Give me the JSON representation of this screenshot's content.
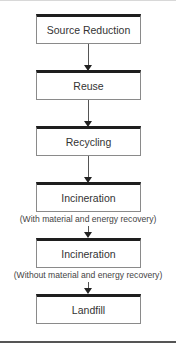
{
  "diagram": {
    "type": "flowchart",
    "direction": "top-to-bottom",
    "boxes": [
      {
        "label": "Source Reduction"
      },
      {
        "label": "Reuse"
      },
      {
        "label": "Recycling"
      },
      {
        "label": "Incineration",
        "caption": "(With material and energy recovery)"
      },
      {
        "label": "Incineration",
        "caption": "(Without material and energy recovery)"
      },
      {
        "label": "Landfill"
      }
    ],
    "colors": {
      "box_top_border": "#1e1e1e",
      "box_border": "#8a8a8a",
      "arrow": "#222222",
      "text": "#333333"
    }
  }
}
